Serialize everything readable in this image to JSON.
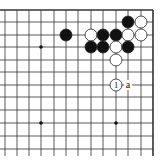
{
  "diagram": {
    "type": "go-board-fragment",
    "corner_label": "",
    "grid": {
      "columns_x": [
        5,
        17,
        29,
        41,
        54,
        66,
        78,
        91,
        103,
        116,
        128,
        141,
        153
      ],
      "rows_y": [
        10,
        22,
        35,
        47,
        60,
        72,
        85,
        97,
        110,
        123,
        136,
        149
      ],
      "edges": {
        "top": true,
        "right": true,
        "left": false,
        "bottom": false
      },
      "line_color": "#333333"
    },
    "star_points": [
      {
        "col": 3,
        "row": 3
      },
      {
        "col": 3,
        "row": 9
      },
      {
        "col": 9,
        "row": 9
      }
    ],
    "stones": [
      {
        "color": "black",
        "col": 10,
        "row": 1
      },
      {
        "color": "white",
        "col": 11,
        "row": 1
      },
      {
        "color": "black",
        "col": 5,
        "row": 2
      },
      {
        "color": "white",
        "col": 7,
        "row": 2
      },
      {
        "color": "black",
        "col": 8,
        "row": 2
      },
      {
        "color": "black",
        "col": 9,
        "row": 2
      },
      {
        "color": "white",
        "col": 10,
        "row": 2
      },
      {
        "color": "white",
        "col": 11,
        "row": 2
      },
      {
        "color": "black",
        "col": 7,
        "row": 3
      },
      {
        "color": "black",
        "col": 8,
        "row": 3
      },
      {
        "color": "white",
        "col": 9,
        "row": 3
      },
      {
        "color": "black",
        "col": 10,
        "row": 3
      },
      {
        "color": "white",
        "col": 9,
        "row": 4
      },
      {
        "color": "white",
        "col": 9,
        "row": 6,
        "label": "1"
      }
    ],
    "markers": [
      {
        "col": 10,
        "row": 6,
        "label": "a"
      }
    ]
  }
}
